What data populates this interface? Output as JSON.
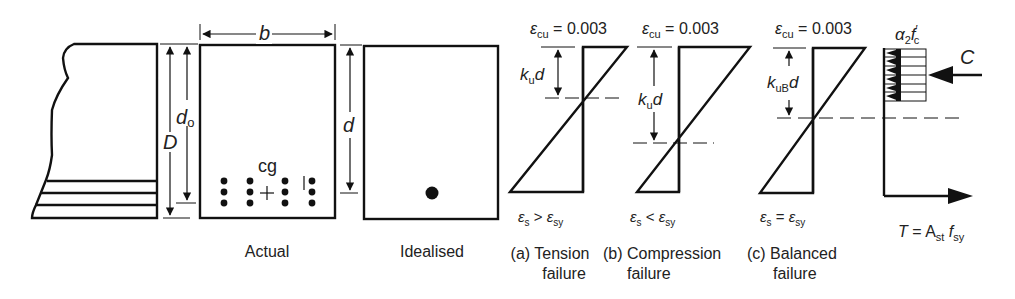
{
  "figure": {
    "elevation": {
      "D_label": "D",
      "do_label": "d",
      "do_sub": "o"
    },
    "actual": {
      "b_label": "b",
      "cg_label": "cg",
      "caption": "Actual"
    },
    "idealised": {
      "d_label": "d",
      "caption": "Idealised"
    },
    "strain_a": {
      "top_eps": "ε",
      "top_sub": "cu",
      "top_val": " = 0.003",
      "k_label": "k",
      "k_sub": "u",
      "k_d": "d",
      "bottom_eps1": "ε",
      "bottom_sub1": "s",
      "bottom_rel": " > ",
      "bottom_eps2": "ε",
      "bottom_sub2": "sy",
      "caption_line1": "(a) Tension",
      "caption_line2": "failure"
    },
    "strain_b": {
      "top_eps": "ε",
      "top_sub": "cu",
      "top_val": " = 0.003",
      "k_label": "k",
      "k_sub": "u",
      "k_d": "d",
      "bottom_eps1": "ε",
      "bottom_sub1": "s",
      "bottom_rel": " < ",
      "bottom_eps2": "ε",
      "bottom_sub2": "sy",
      "caption_line1": "(b) Compression",
      "caption_line2": "failure"
    },
    "strain_c": {
      "top_eps": "ε",
      "top_sub": "cu",
      "top_val": " = 0.003",
      "k_label": "k",
      "k_sub": "uB",
      "k_d": "d",
      "bottom_eps1": "ε",
      "bottom_sub1": "s",
      "bottom_rel": " = ",
      "bottom_eps2": "ε",
      "bottom_sub2": "sy",
      "caption_line1": "(c) Balanced",
      "caption_line2": "failure"
    },
    "stress": {
      "alpha": "α",
      "alpha_sub": "2",
      "fc": "f",
      "fc_sup": "′",
      "fc_sub": "c",
      "C_label": "C",
      "T_label": "T",
      "T_eq": " = A",
      "T_sub1": "st",
      "T_f": " f",
      "T_sub2": "sy"
    }
  }
}
